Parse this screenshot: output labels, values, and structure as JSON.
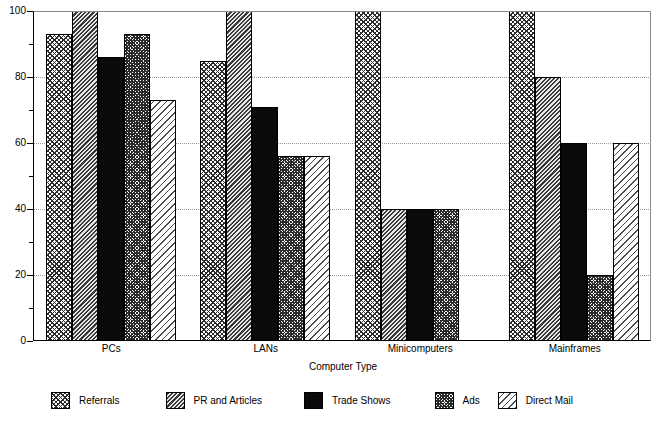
{
  "chart_data": {
    "type": "bar",
    "title": "",
    "subtitle": "",
    "xlabel": "Computer Type",
    "ylabel": "",
    "ylim": [
      0,
      100
    ],
    "grid": true,
    "legend_position": "bottom",
    "categories": [
      "PCs",
      "LANs",
      "Minicomputers",
      "Mainframes"
    ],
    "y_ticks_major": [
      0,
      20,
      40,
      60,
      80,
      100
    ],
    "y_ticks_minor": [
      10,
      30,
      50,
      70,
      90
    ],
    "series": [
      {
        "name": "Referrals",
        "pattern": "cross-hatch",
        "values": [
          93,
          85,
          100,
          100
        ]
      },
      {
        "name": "PR and Articles",
        "pattern": "diagonal-hatch",
        "values": [
          100,
          100,
          40,
          80
        ]
      },
      {
        "name": "Trade Shows",
        "pattern": "solid-black",
        "values": [
          86,
          71,
          40,
          60
        ]
      },
      {
        "name": "Ads",
        "pattern": "dense-cross-hatch",
        "values": [
          93,
          56,
          40,
          20
        ]
      },
      {
        "name": "Direct Mail",
        "pattern": "light-diagonal",
        "values": [
          73,
          56,
          0,
          60
        ]
      }
    ]
  },
  "axis": {
    "y_tick_labels": [
      "100",
      "80",
      "60",
      "40",
      "20",
      "0"
    ],
    "x_title": "Computer Type"
  },
  "legend": {
    "items": [
      {
        "label": "Referrals"
      },
      {
        "label": "PR and Articles"
      },
      {
        "label": "Trade Shows"
      },
      {
        "label": "Ads"
      },
      {
        "label": "Direct Mail"
      }
    ]
  }
}
